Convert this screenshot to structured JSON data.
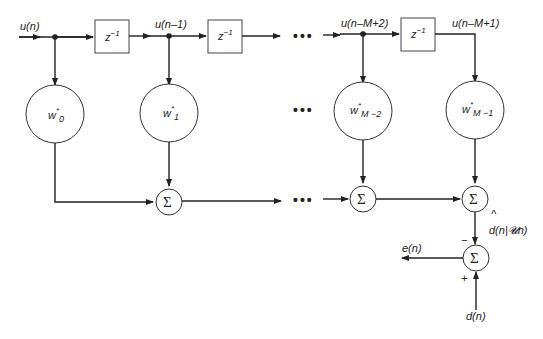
{
  "diagram": {
    "type": "transversal FIR filter (Wiener filter)",
    "input_labels": {
      "u_n": "u(n)",
      "u_n_1": "u(n–1)",
      "u_n_M2": "u(n–M+2)",
      "u_n_M1": "u(n–M+1)"
    },
    "delay_label": "z",
    "delay_exp": "−1",
    "weights": [
      {
        "base": "w",
        "star": "*",
        "sub": "0"
      },
      {
        "base": "w",
        "star": "*",
        "sub": "1"
      },
      {
        "base": "w",
        "star": "*",
        "sub": "M −2"
      },
      {
        "base": "w",
        "star": "*",
        "sub": "M −1"
      }
    ],
    "sum_symbol": "Σ",
    "ellipsis": "•••",
    "estimate_label": "d(n|𝓤n)",
    "estimate_hat": "^",
    "error_label": "e(n)",
    "desired_label": "d(n)",
    "minus_sign": "−",
    "plus_sign": "+"
  }
}
